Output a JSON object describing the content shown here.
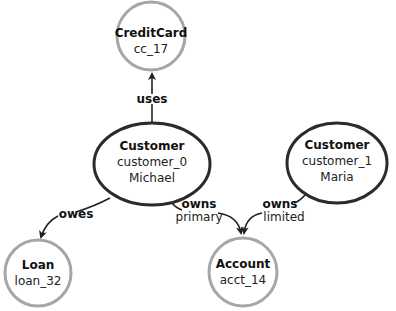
{
  "nodes": {
    "creditcard": {
      "type": "CreditCard",
      "id": "cc_17"
    },
    "customer0": {
      "type": "Customer",
      "id": "customer_0",
      "name": "Michael"
    },
    "customer1": {
      "type": "Customer",
      "id": "customer_1",
      "name": "Maria"
    },
    "loan": {
      "type": "Loan",
      "id": "loan_32"
    },
    "account": {
      "type": "Account",
      "id": "acct_14"
    }
  },
  "edges": {
    "uses": {
      "label": "uses"
    },
    "owes": {
      "label": "owes"
    },
    "owns0": {
      "label": "owns",
      "sublabel": "primary"
    },
    "owns1": {
      "label": "owns",
      "sublabel": "limited"
    }
  },
  "colors": {
    "primary_node_border": "#2b2b2b",
    "secondary_node_border": "#a6a6a6",
    "edge": "#222222"
  }
}
